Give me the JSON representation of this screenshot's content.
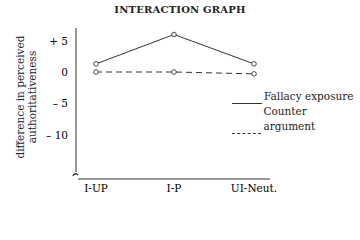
{
  "chart_data": {
    "type": "line",
    "title": "INTERACTION GRAPH",
    "xlabel": "",
    "ylabel": "difference in perceived authoritativeness",
    "categories": [
      "I-UP",
      "I-P",
      "UI-Neut."
    ],
    "series": [
      {
        "name": "Fallacy exposure",
        "style": "solid",
        "values": [
          1.3,
          6.0,
          1.3
        ]
      },
      {
        "name": "Counter argument",
        "style": "dashed",
        "values": [
          0.0,
          0.0,
          -0.3
        ]
      }
    ],
    "yticks": [
      5,
      0,
      -5,
      -10
    ],
    "ytick_labels": [
      "+ 5",
      "0",
      "– 5",
      "– 10"
    ],
    "ylim": [
      -14,
      7
    ],
    "axis_break": true,
    "grid": false,
    "legend_position": "right"
  },
  "title": "INTERACTION GRAPH",
  "ylabel_line1": "difference in perceived",
  "ylabel_line2": "authoritativeness",
  "legend": [
    {
      "label": "Fallacy exposure"
    },
    {
      "label": "Counter argument"
    }
  ]
}
